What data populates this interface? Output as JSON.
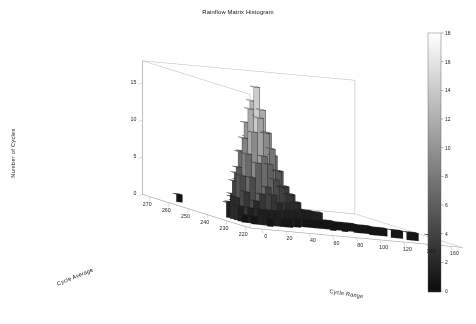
{
  "chart_data": {
    "type": "bar",
    "subtype": "3d-histogram",
    "title": "Rainflow Matrix Histogram",
    "xlabel": "Cycle Range",
    "ylabel": "Cycle Average",
    "zlabel": "Number of Cycles",
    "xticks": [
      0,
      20,
      40,
      60,
      80,
      100,
      120,
      140,
      160
    ],
    "yticks": [
      270,
      260,
      250,
      240,
      230,
      220
    ],
    "zticks": [
      0,
      5,
      10,
      15
    ],
    "xlim": [
      -10,
      170
    ],
    "ylim": [
      218,
      274
    ],
    "zlim": [
      0,
      18
    ],
    "grid": false,
    "colormap": "gray",
    "colorbar": {
      "position": "right",
      "ticks": [
        0,
        2,
        4,
        6,
        8,
        10,
        12,
        14,
        16,
        18
      ],
      "vmin": 0,
      "vmax": 18
    },
    "x_bin_width": 5,
    "y_bin_width": 2,
    "bars": [
      [
        265,
        5,
        1
      ],
      [
        239,
        5,
        2
      ],
      [
        237,
        5,
        3
      ],
      [
        235,
        5,
        3
      ],
      [
        233,
        5,
        2
      ],
      [
        231,
        5,
        1
      ],
      [
        241,
        10,
        2
      ],
      [
        239,
        10,
        5
      ],
      [
        237,
        10,
        7
      ],
      [
        235,
        10,
        6
      ],
      [
        233,
        10,
        4
      ],
      [
        231,
        10,
        2
      ],
      [
        229,
        10,
        1
      ],
      [
        243,
        15,
        3
      ],
      [
        241,
        15,
        6
      ],
      [
        239,
        15,
        9
      ],
      [
        237,
        15,
        11
      ],
      [
        235,
        15,
        9
      ],
      [
        233,
        15,
        6
      ],
      [
        231,
        15,
        3
      ],
      [
        229,
        15,
        2
      ],
      [
        245,
        20,
        2
      ],
      [
        243,
        20,
        5
      ],
      [
        241,
        20,
        9
      ],
      [
        239,
        20,
        13
      ],
      [
        237,
        20,
        15
      ],
      [
        235,
        20,
        12
      ],
      [
        233,
        20,
        8
      ],
      [
        231,
        20,
        4
      ],
      [
        229,
        20,
        2
      ],
      [
        227,
        20,
        1
      ],
      [
        245,
        25,
        3
      ],
      [
        243,
        25,
        7
      ],
      [
        241,
        25,
        11
      ],
      [
        239,
        25,
        16
      ],
      [
        237,
        25,
        18
      ],
      [
        235,
        25,
        14
      ],
      [
        233,
        25,
        9
      ],
      [
        231,
        25,
        5
      ],
      [
        229,
        25,
        2
      ],
      [
        245,
        30,
        2
      ],
      [
        243,
        30,
        6
      ],
      [
        241,
        30,
        10
      ],
      [
        239,
        30,
        14
      ],
      [
        237,
        30,
        15
      ],
      [
        235,
        30,
        12
      ],
      [
        233,
        30,
        8
      ],
      [
        231,
        30,
        4
      ],
      [
        229,
        30,
        2
      ],
      [
        243,
        35,
        4
      ],
      [
        241,
        35,
        8
      ],
      [
        239,
        35,
        11
      ],
      [
        237,
        35,
        12
      ],
      [
        235,
        35,
        10
      ],
      [
        233,
        35,
        6
      ],
      [
        231,
        35,
        3
      ],
      [
        229,
        35,
        1
      ],
      [
        243,
        40,
        3
      ],
      [
        241,
        40,
        6
      ],
      [
        239,
        40,
        8
      ],
      [
        237,
        40,
        9
      ],
      [
        235,
        40,
        7
      ],
      [
        233,
        40,
        5
      ],
      [
        231,
        40,
        2
      ],
      [
        229,
        40,
        1
      ],
      [
        241,
        45,
        4
      ],
      [
        239,
        45,
        6
      ],
      [
        237,
        45,
        7
      ],
      [
        235,
        45,
        5
      ],
      [
        233,
        45,
        3
      ],
      [
        231,
        45,
        2
      ],
      [
        241,
        50,
        3
      ],
      [
        239,
        50,
        4
      ],
      [
        237,
        50,
        5
      ],
      [
        235,
        50,
        4
      ],
      [
        233,
        50,
        2
      ],
      [
        231,
        50,
        1
      ],
      [
        241,
        55,
        2
      ],
      [
        239,
        55,
        3
      ],
      [
        237,
        55,
        4
      ],
      [
        235,
        55,
        3
      ],
      [
        233,
        55,
        2
      ],
      [
        239,
        60,
        2
      ],
      [
        237,
        60,
        3
      ],
      [
        235,
        60,
        2
      ],
      [
        233,
        60,
        1
      ],
      [
        239,
        65,
        2
      ],
      [
        237,
        65,
        2
      ],
      [
        235,
        65,
        2
      ],
      [
        233,
        65,
        1
      ],
      [
        237,
        70,
        2
      ],
      [
        235,
        70,
        2
      ],
      [
        233,
        70,
        1
      ],
      [
        237,
        75,
        1
      ],
      [
        235,
        75,
        2
      ],
      [
        233,
        75,
        1
      ],
      [
        235,
        80,
        1
      ],
      [
        233,
        80,
        1
      ],
      [
        231,
        80,
        1
      ],
      [
        235,
        85,
        1
      ],
      [
        233,
        85,
        1
      ],
      [
        233,
        90,
        1
      ],
      [
        231,
        90,
        1
      ],
      [
        233,
        95,
        1
      ],
      [
        231,
        100,
        1
      ],
      [
        233,
        100,
        1
      ],
      [
        231,
        105,
        1
      ],
      [
        229,
        110,
        1
      ],
      [
        231,
        110,
        1
      ],
      [
        229,
        115,
        1
      ],
      [
        229,
        120,
        1
      ],
      [
        227,
        125,
        1
      ],
      [
        227,
        130,
        1
      ],
      [
        225,
        135,
        1
      ],
      [
        225,
        140,
        1
      ],
      [
        223,
        150,
        1
      ]
    ]
  }
}
